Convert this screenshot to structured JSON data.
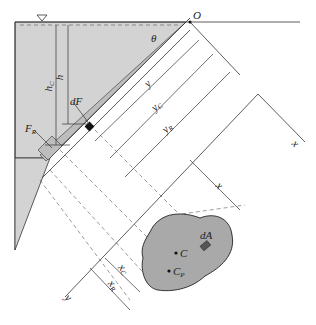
{
  "diagram": {
    "colors": {
      "water": "#d3d3d3",
      "plate": "#a9a9a9",
      "line": "#333333",
      "dashed": "#555555"
    },
    "labels": {
      "origin": "O",
      "angle": "θ",
      "h_c": "h",
      "h_c_sub": "C",
      "h": "h",
      "dF": "dF",
      "F_R": "F",
      "F_R_sub": "R",
      "y": "y",
      "y_c": "y",
      "y_c_sub": "C",
      "y_r": "y",
      "y_r_sub": "R",
      "x_axis": "x",
      "x_dim": "x",
      "y_axis": "y",
      "x_c": "x",
      "x_c_sub": "C",
      "x_r": "x",
      "x_r_sub": "R",
      "C": "C",
      "C_P": "C",
      "C_P_sub": "P",
      "dA": "dA"
    },
    "free_surface_symbol": "▽"
  }
}
